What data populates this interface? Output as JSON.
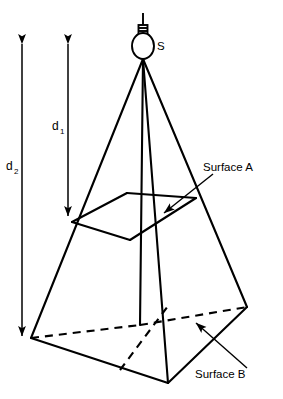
{
  "figure": {
    "background_color": "#ffffff",
    "line_color": "#000000"
  },
  "source": {
    "icon": "light-bulb-icon",
    "label": "S"
  },
  "dimensions": [
    {
      "id": "d1",
      "base": "d",
      "subscript": "1",
      "label": "d1",
      "description": "distance from source to Surface A"
    },
    {
      "id": "d2",
      "base": "d",
      "subscript": "2",
      "label": "d2",
      "description": "distance from source to Surface B"
    }
  ],
  "surfaces": [
    {
      "id": "surface-a",
      "label": "Surface A",
      "position": "upper-inner-square"
    },
    {
      "id": "surface-b",
      "label": "Surface B",
      "position": "lower-base-square"
    }
  ],
  "geometry": {
    "apex": [
      143,
      60
    ],
    "surface_a_corners": [
      [
        127,
        193
      ],
      [
        196,
        198
      ],
      [
        130,
        240
      ],
      [
        72,
        222
      ]
    ],
    "surface_b_corners": [
      [
        140,
        325
      ],
      [
        247,
        307
      ],
      [
        168,
        383
      ],
      [
        31,
        338
      ]
    ],
    "hidden_vertex": [
      140,
      325
    ]
  }
}
